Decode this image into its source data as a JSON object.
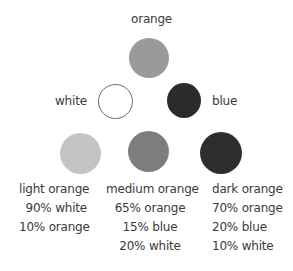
{
  "primaries": {
    "orange": {
      "label": "orange",
      "color": "#9a9a9a"
    },
    "white": {
      "label": "white",
      "color": "#ffffff",
      "stroke": "#6a6a6a"
    },
    "blue": {
      "label": "blue",
      "color": "#2b2b2b"
    }
  },
  "mixes": [
    {
      "name": "light orange",
      "color": "#c4c4c4",
      "parts": [
        "90% white",
        "10% orange"
      ]
    },
    {
      "name": "medium orange",
      "color": "#7d7d7d",
      "parts": [
        "65% orange",
        "15% blue",
        "20% white"
      ]
    },
    {
      "name": "dark orange",
      "color": "#2e2e2e",
      "parts": [
        "70% orange",
        "20% blue",
        "10% white"
      ]
    }
  ]
}
